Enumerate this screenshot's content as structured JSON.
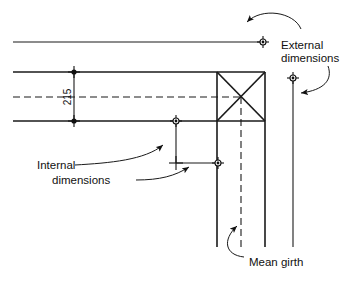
{
  "figure": {
    "type": "engineering-dimension-diagram",
    "background_color": "#ffffff",
    "line_color": "#1a1a1a",
    "dimensions_px": {
      "width": 353,
      "height": 283
    }
  },
  "annotations": {
    "external": {
      "line1": "External",
      "line2": "dimensions"
    },
    "internal": {
      "line1": "Internal",
      "line2": "dimensions"
    },
    "mean_girth": {
      "label": "Mean girth"
    }
  },
  "dimension_values": {
    "wall_thickness": "215"
  },
  "geometry": {
    "wall_outer_y": 72,
    "wall_inner_y": 121,
    "wall_centre_y": 97,
    "external_offset_y": 42,
    "corner_box_left_x": 217,
    "corner_box_right_x": 265,
    "mean_girth_x": 241,
    "external_return_x": 293,
    "internal_return_x": 176
  },
  "icons": {
    "dim_origin": "dimension-origin-marker",
    "arrow": "leader-arrowhead",
    "cross_tick": "cross-tick-marker"
  }
}
